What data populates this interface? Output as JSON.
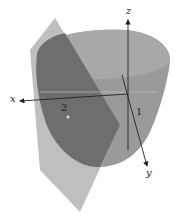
{
  "diagram": {
    "type": "3d-surface-plot",
    "axes": {
      "x": {
        "label": "x"
      },
      "y": {
        "label": "y"
      },
      "z": {
        "label": "z"
      }
    },
    "tick_labels": {
      "x_tick": "2",
      "y_tick": "1"
    },
    "surfaces": [
      {
        "name": "paraboloid",
        "color": "#8f8f8f"
      },
      {
        "name": "plane",
        "color": "#b8b8b8"
      }
    ],
    "intersection_color": "#6a6a6a",
    "background": "#ffffff"
  }
}
